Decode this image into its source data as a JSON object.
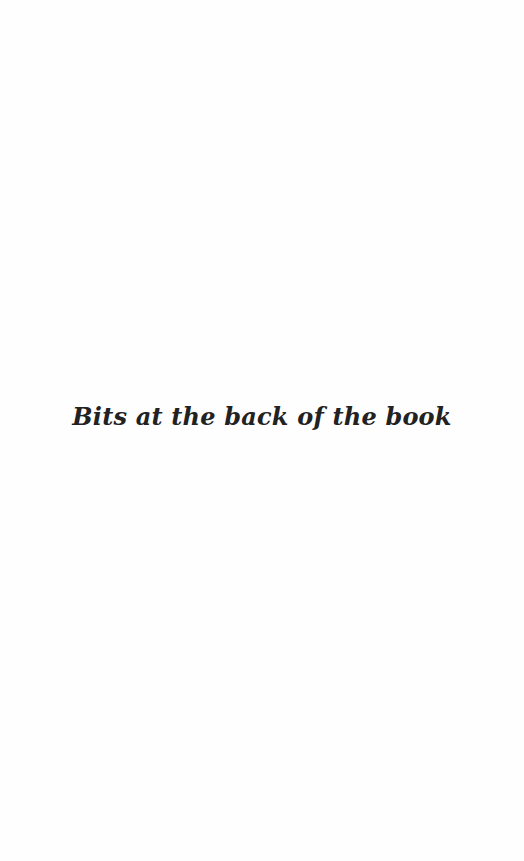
{
  "page": {
    "section_title": "Bits at the back of the book",
    "colors": {
      "background": "#fefefe",
      "text": "#222222"
    }
  }
}
